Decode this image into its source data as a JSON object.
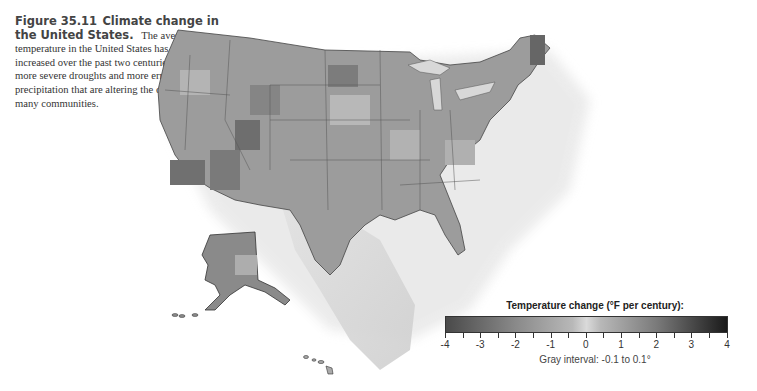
{
  "caption": {
    "figure_label": "Figure 35.11",
    "figure_title": "Climate change in the United States.",
    "body": "The average temperature in the United States has steadily increased over the past two centuries, leading to more severe droughts and more erratic periods of precipitation that are altering the composition of many communities."
  },
  "map": {
    "subject": "United States temperature change map",
    "regions": [
      "Contiguous United States",
      "Alaska",
      "Hawaii"
    ],
    "color_scheme": "grayscale"
  },
  "legend": {
    "title": "Temperature change (°F per century):",
    "tick_labels": [
      "-4",
      "-3",
      "-2",
      "-1",
      "0",
      "1",
      "2",
      "3",
      "4"
    ],
    "note": "Gray interval: -0.1 to 0.1°",
    "colors": {
      "low": "#4a4a4a",
      "mid": "#d4d4d4",
      "high": "#1a1a1a"
    }
  }
}
